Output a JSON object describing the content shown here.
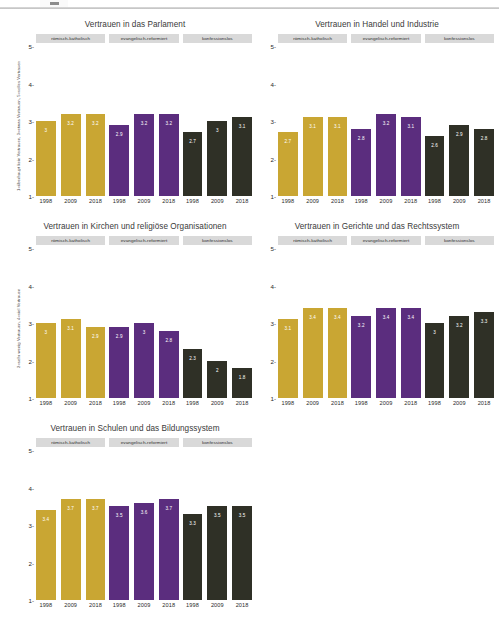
{
  "page": {
    "background_color": "#ffffff",
    "rule_color": "#b8b8b8"
  },
  "palette": {
    "roemisch_katholisch": "#C9A633",
    "evangelisch_reformiert": "#5B2D7E",
    "konfessionslos": "#2F3026",
    "strip_background": "#D9D9D9",
    "label_text": "#FFFFFF"
  },
  "facet_labels": [
    "römisch-katholisch",
    "evangelisch-reformiert",
    "konfessionslos"
  ],
  "years": [
    "1998",
    "2009",
    "2018"
  ],
  "axis": {
    "y_ticks": [
      "5",
      "4",
      "3",
      "2",
      "1"
    ],
    "y_min": 1,
    "y_max": 5
  },
  "chart_data": [
    {
      "type": "bar",
      "id": "parlament",
      "title": "Vertrauen in das Parlament",
      "ylabel": "1=überhaupt kein Vertrauen, 3=etwas Vertrauen, 5=volles Vertrauen",
      "xlabel": "",
      "categories": [
        "1998",
        "2009",
        "2018"
      ],
      "ylim": [
        1,
        5
      ],
      "grid": false,
      "legend": "none",
      "series": [
        {
          "name": "römisch-katholisch",
          "values": [
            3,
            3.2,
            3.2
          ],
          "labels": [
            "3",
            "3.2",
            "3.2"
          ]
        },
        {
          "name": "evangelisch-reformiert",
          "values": [
            2.9,
            3.2,
            3.2
          ],
          "labels": [
            "2.9",
            "3.2",
            "3.2"
          ]
        },
        {
          "name": "konfessionslos",
          "values": [
            2.7,
            3,
            3.1
          ],
          "labels": [
            "2.7",
            "3",
            "3.1"
          ]
        }
      ]
    },
    {
      "type": "bar",
      "id": "handel",
      "title": "Vertrauen in Handel und Industrie",
      "ylabel": "",
      "xlabel": "",
      "categories": [
        "1998",
        "2009",
        "2018"
      ],
      "ylim": [
        1,
        5
      ],
      "grid": false,
      "legend": "none",
      "series": [
        {
          "name": "römisch-katholisch",
          "values": [
            2.7,
            3.1,
            3.1
          ],
          "labels": [
            "2.7",
            "3.1",
            "3.1"
          ]
        },
        {
          "name": "evangelisch-reformiert",
          "values": [
            2.8,
            3.2,
            3.1
          ],
          "labels": [
            "2.8",
            "3.2",
            "3.1"
          ]
        },
        {
          "name": "konfessionslos",
          "values": [
            2.6,
            2.9,
            2.8
          ],
          "labels": [
            "2.6",
            "2.9",
            "2.8"
          ]
        }
      ]
    },
    {
      "type": "bar",
      "id": "kirchen",
      "title": "Vertrauen in Kirchen und religiöse Organisationen",
      "ylabel": "2=sehr wenig Vertrauen, 4=viel Vertrauen",
      "xlabel": "",
      "categories": [
        "1998",
        "2009",
        "2018"
      ],
      "ylim": [
        1,
        5
      ],
      "grid": false,
      "legend": "none",
      "series": [
        {
          "name": "römisch-katholisch",
          "values": [
            3,
            3.1,
            2.9
          ],
          "labels": [
            "3",
            "3.1",
            "2.9"
          ]
        },
        {
          "name": "evangelisch-reformiert",
          "values": [
            2.9,
            3,
            2.8
          ],
          "labels": [
            "2.9",
            "3",
            "2.8"
          ]
        },
        {
          "name": "konfessionslos",
          "values": [
            2.3,
            2,
            1.8
          ],
          "labels": [
            "2.3",
            "2",
            "1.8"
          ]
        }
      ]
    },
    {
      "type": "bar",
      "id": "gerichte",
      "title": "Vertrauen in Gerichte und das Rechtssystem",
      "ylabel": "",
      "xlabel": "",
      "categories": [
        "1998",
        "2009",
        "2018"
      ],
      "ylim": [
        1,
        5
      ],
      "grid": false,
      "legend": "none",
      "series": [
        {
          "name": "römisch-katholisch",
          "values": [
            3.1,
            3.4,
            3.4
          ],
          "labels": [
            "3.1",
            "3.4",
            "3.4"
          ]
        },
        {
          "name": "evangelisch-reformiert",
          "values": [
            3.2,
            3.4,
            3.4
          ],
          "labels": [
            "3.2",
            "3.4",
            "3.4"
          ]
        },
        {
          "name": "konfessionslos",
          "values": [
            3,
            3.2,
            3.3
          ],
          "labels": [
            "3",
            "3.2",
            "3.3"
          ]
        }
      ]
    },
    {
      "type": "bar",
      "id": "schulen",
      "title": "Vertrauen in Schulen und das Bildungssystem",
      "ylabel": "",
      "xlabel": "",
      "categories": [
        "1998",
        "2009",
        "2018"
      ],
      "ylim": [
        1,
        5
      ],
      "grid": false,
      "legend": "none",
      "series": [
        {
          "name": "römisch-katholisch",
          "values": [
            3.4,
            3.7,
            3.7
          ],
          "labels": [
            "3.4",
            "3.7",
            "3.7"
          ]
        },
        {
          "name": "evangelisch-reformiert",
          "values": [
            3.5,
            3.6,
            3.7
          ],
          "labels": [
            "3.5",
            "3.6",
            "3.7"
          ]
        },
        {
          "name": "konfessionslos",
          "values": [
            3.3,
            3.5,
            3.5
          ],
          "labels": [
            "3.3",
            "3.5",
            "3.5"
          ]
        }
      ]
    }
  ]
}
